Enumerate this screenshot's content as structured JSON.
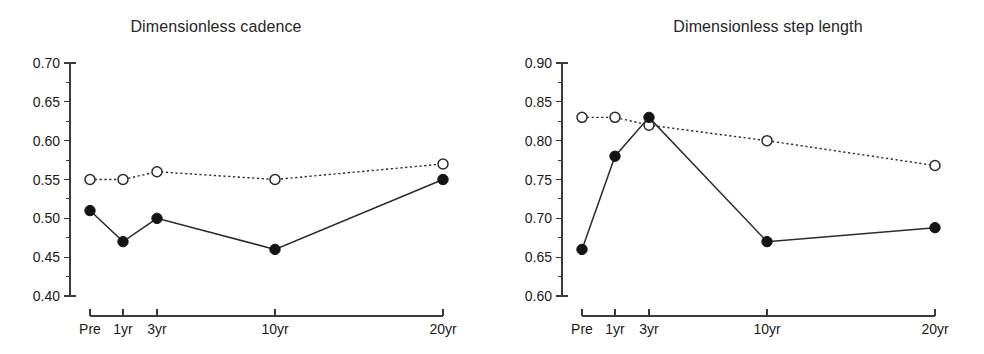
{
  "figure": {
    "width": 984,
    "height": 354,
    "background": "#ffffff",
    "ink_color": "#1a1a1a"
  },
  "panels": [
    {
      "id": "dimensionless-cadence",
      "title": "Dimensionless cadence"
    },
    {
      "id": "dimensionless-step-length",
      "title": "Dimensionless step length"
    }
  ],
  "chart_data": [
    {
      "type": "line",
      "title": "Dimensionless cadence",
      "xlabel": "",
      "ylabel": "",
      "x": [
        "Pre",
        "1yr",
        "3yr",
        "10yr",
        "20yr"
      ],
      "x_positions": [
        0,
        1,
        3,
        10,
        20
      ],
      "categories": [
        "Pre",
        "1yr",
        "3yr",
        "10yr",
        "20yr"
      ],
      "ylim": [
        0.4,
        0.7
      ],
      "yticks": [
        0.4,
        0.45,
        0.5,
        0.55,
        0.6,
        0.65,
        0.7
      ],
      "ytick_labels": [
        "0.40",
        "0.45",
        "0.50",
        "0.55",
        "0.60",
        "0.65",
        "0.70"
      ],
      "minor_ticks": true,
      "grid": false,
      "legend": "none",
      "series": [
        {
          "name": "open-circle-dotted",
          "marker": "open-circle",
          "line": "dotted",
          "values": [
            0.55,
            0.55,
            0.56,
            0.55,
            0.57
          ]
        },
        {
          "name": "filled-circle-solid",
          "marker": "filled-circle",
          "line": "solid",
          "values": [
            0.51,
            0.47,
            0.5,
            0.46,
            0.55
          ]
        }
      ]
    },
    {
      "type": "line",
      "title": "Dimensionless step length",
      "xlabel": "",
      "ylabel": "",
      "x": [
        "Pre",
        "1yr",
        "3yr",
        "10yr",
        "20yr"
      ],
      "x_positions": [
        0,
        1,
        3,
        10,
        20
      ],
      "categories": [
        "Pre",
        "1yr",
        "3yr",
        "10yr",
        "20yr"
      ],
      "ylim": [
        0.6,
        0.9
      ],
      "yticks": [
        0.6,
        0.65,
        0.7,
        0.75,
        0.8,
        0.85,
        0.9
      ],
      "ytick_labels": [
        "0.60",
        "0.65",
        "0.70",
        "0.75",
        "0.80",
        "0.85",
        "0.90"
      ],
      "minor_ticks": true,
      "grid": false,
      "legend": "none",
      "series": [
        {
          "name": "open-circle-dotted",
          "marker": "open-circle",
          "line": "dotted",
          "values": [
            0.83,
            0.83,
            0.82,
            0.8,
            0.768
          ]
        },
        {
          "name": "filled-circle-solid",
          "marker": "filled-circle",
          "line": "solid",
          "values": [
            0.66,
            0.78,
            0.83,
            0.67,
            0.688
          ]
        }
      ]
    }
  ]
}
